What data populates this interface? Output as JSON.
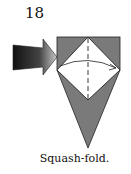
{
  "diagram": {
    "step_number": "18",
    "caption": "Squash-fold.",
    "colors": {
      "paper_colored": "#7a7a7a",
      "paper_white": "#ffffff",
      "outline": "#222222",
      "arrow_dark": "#111111",
      "arrow_light": "#bbbbbb"
    },
    "elements": [
      "push-arrow",
      "top-square",
      "white-diamond",
      "valley-fold-line",
      "fold-over-arrow",
      "lower-point"
    ]
  }
}
